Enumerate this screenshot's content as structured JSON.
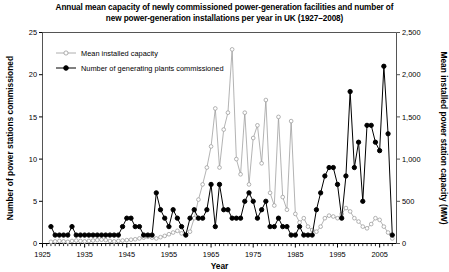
{
  "chart_data": {
    "type": "line",
    "title": "Annual mean capacity of newly commissioned power-generation facilities and number of new power-generation installations per year in UK (1927–2008)",
    "xlabel": "Year",
    "ylabel": "Number of power stations commissioned",
    "y2label": "Mean installed power station capacity (MW)",
    "xlim": [
      1925,
      2009
    ],
    "ylim": [
      0,
      25
    ],
    "y2lim": [
      0,
      2500
    ],
    "xticks": [
      1925,
      1935,
      1945,
      1955,
      1965,
      1975,
      1985,
      1995,
      2005
    ],
    "xticklabels": [
      "1925",
      "1935",
      "1945",
      "1955",
      "1965",
      "1975",
      "1985",
      "1995",
      "2005"
    ],
    "yticks": [
      0,
      5,
      10,
      15,
      20,
      25
    ],
    "yticklabels": [
      "0",
      "5",
      "10",
      "15",
      "20",
      "25"
    ],
    "y2ticks": [
      0,
      500,
      1000,
      1500,
      2000,
      2500
    ],
    "y2ticklabels": [
      "0",
      "500",
      "1,000",
      "1,500",
      "2,000",
      "2,500"
    ],
    "grid": false,
    "legend_position": "top-left-inside",
    "series": [
      {
        "name": "Mean installed capacity",
        "axis": "right",
        "marker": "open-circle",
        "color": "#999999",
        "x": [
          1927,
          1928,
          1929,
          1930,
          1931,
          1932,
          1933,
          1934,
          1935,
          1936,
          1937,
          1938,
          1939,
          1940,
          1941,
          1942,
          1943,
          1944,
          1945,
          1946,
          1947,
          1948,
          1949,
          1950,
          1951,
          1952,
          1953,
          1954,
          1955,
          1956,
          1957,
          1958,
          1959,
          1960,
          1961,
          1962,
          1963,
          1964,
          1965,
          1966,
          1967,
          1968,
          1969,
          1970,
          1971,
          1972,
          1973,
          1974,
          1975,
          1976,
          1977,
          1978,
          1979,
          1980,
          1981,
          1982,
          1983,
          1984,
          1985,
          1986,
          1987,
          1988,
          1989,
          1990,
          1991,
          1992,
          1993,
          1994,
          1995,
          1996,
          1997,
          1998,
          1999,
          2000,
          2001,
          2002,
          2003,
          2004,
          2005,
          2006,
          2007,
          2008
        ],
        "values": [
          20,
          25,
          30,
          25,
          20,
          30,
          35,
          30,
          25,
          30,
          35,
          40,
          45,
          40,
          30,
          25,
          30,
          35,
          40,
          45,
          50,
          60,
          70,
          80,
          70,
          60,
          75,
          90,
          110,
          130,
          150,
          120,
          100,
          140,
          300,
          520,
          700,
          900,
          1150,
          1600,
          900,
          1350,
          1550,
          2300,
          1000,
          820,
          1550,
          700,
          1250,
          1400,
          950,
          1700,
          600,
          450,
          1500,
          550,
          400,
          1450,
          350,
          250,
          300,
          200,
          160,
          140,
          200,
          300,
          330,
          320,
          300,
          350,
          420,
          380,
          300,
          260,
          200,
          180,
          230,
          300,
          280,
          200,
          130,
          60
        ]
      },
      {
        "name": "Number of generating plants commissioned",
        "axis": "left",
        "marker": "filled-circle",
        "color": "#000000",
        "x": [
          1927,
          1928,
          1929,
          1930,
          1931,
          1932,
          1933,
          1934,
          1935,
          1936,
          1937,
          1938,
          1939,
          1940,
          1941,
          1942,
          1943,
          1944,
          1945,
          1946,
          1947,
          1948,
          1949,
          1950,
          1951,
          1952,
          1953,
          1954,
          1955,
          1956,
          1957,
          1958,
          1959,
          1960,
          1961,
          1962,
          1963,
          1964,
          1965,
          1966,
          1967,
          1968,
          1969,
          1970,
          1971,
          1972,
          1973,
          1974,
          1975,
          1976,
          1977,
          1978,
          1979,
          1980,
          1981,
          1982,
          1983,
          1984,
          1985,
          1986,
          1987,
          1988,
          1989,
          1990,
          1991,
          1992,
          1993,
          1994,
          1995,
          1996,
          1997,
          1998,
          1999,
          2000,
          2001,
          2002,
          2003,
          2004,
          2005,
          2006,
          2007,
          2008
        ],
        "values": [
          2,
          1,
          1,
          1,
          1,
          2,
          1,
          1,
          1,
          1,
          1,
          1,
          1,
          1,
          1,
          1,
          1,
          2,
          3,
          3,
          2,
          2,
          1,
          1,
          1,
          6,
          4,
          3,
          2,
          4,
          3,
          2,
          1,
          3,
          4,
          3,
          3,
          4,
          7,
          2,
          7,
          4,
          4,
          3,
          3,
          3,
          5,
          6,
          5,
          3,
          4,
          5,
          2,
          2,
          3,
          2,
          2,
          1,
          1,
          2,
          1,
          1,
          1,
          4,
          6,
          8,
          9,
          9,
          7,
          3,
          8,
          18,
          9,
          12,
          5,
          14,
          14,
          12,
          11,
          21,
          13,
          1
        ]
      }
    ]
  },
  "axis_titles": {
    "x": "Year",
    "y_left": "Number of power stations commissioned",
    "y_right": "Mean installed power station capacity (MW)"
  },
  "legend": {
    "items": [
      {
        "label": "Mean installed capacity",
        "marker": "open-circle"
      },
      {
        "label": "Number of generating plants commissioned",
        "marker": "filled-circle"
      }
    ]
  },
  "title": {
    "line1": "Annual mean capacity of newly commissioned power-generation facilities and number of",
    "line2": "new power-generation installations per year in UK (1927–2008)"
  }
}
